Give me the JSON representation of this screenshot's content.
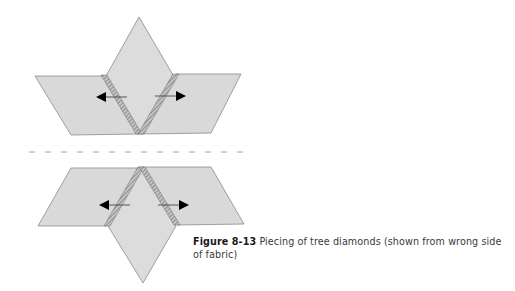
{
  "figure": {
    "label": "Figure 8-13",
    "caption_text": " Piecing of tree diamonds (shown from wrong side of fabric)",
    "colors": {
      "diamond_fill": "#d9d9d9",
      "diamond_stroke": "#8a8a8a",
      "seam_fill": "#bdbdbd",
      "seam_hatch": "#555555",
      "arrow": "#000000",
      "dash_line": "#9a9a9a"
    },
    "panels": [
      {
        "name": "top-assembly",
        "orientation": "point-up",
        "arrows": [
          "left",
          "right"
        ]
      },
      {
        "name": "bottom-assembly",
        "orientation": "point-down",
        "arrows": [
          "left",
          "right"
        ]
      }
    ],
    "divider": {
      "style": "dashed",
      "dash_count": 14
    }
  }
}
